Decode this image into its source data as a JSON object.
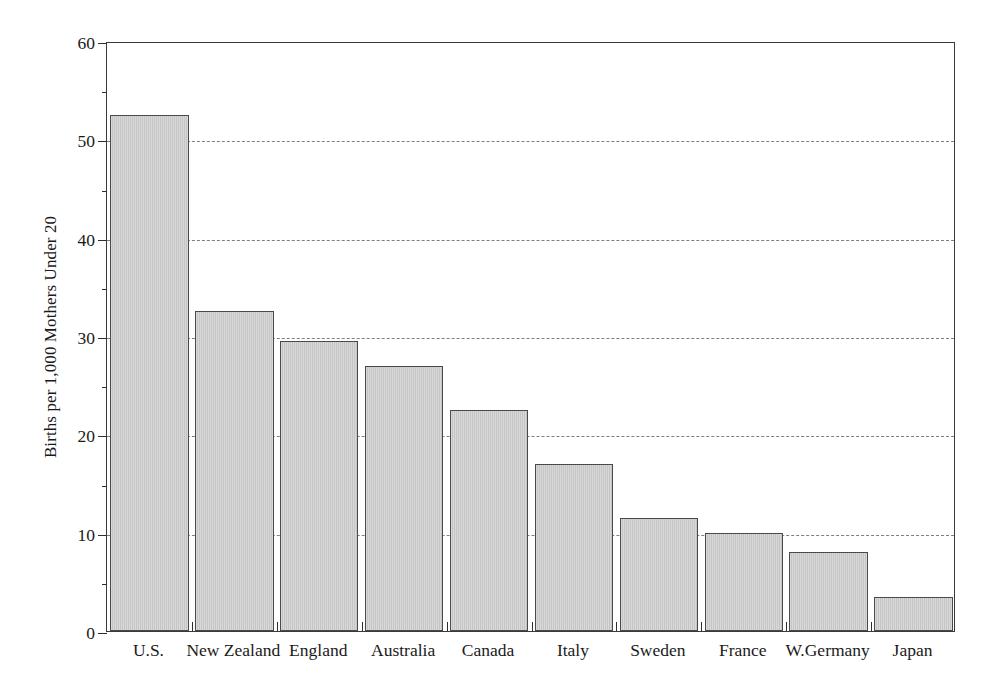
{
  "chart_data": {
    "type": "bar",
    "title": "",
    "subtitle": "",
    "xlabel": "",
    "ylabel": "Births per 1,000 Mothers Under 20",
    "categories": [
      "U.S.",
      "New Zealand",
      "England",
      "Australia",
      "Canada",
      "Italy",
      "Sweden",
      "France",
      "W.Germany",
      "Japan"
    ],
    "values": [
      52.5,
      32.5,
      29.5,
      27.0,
      22.5,
      17.0,
      11.5,
      10.0,
      8.0,
      3.5
    ],
    "ylim": [
      0,
      60
    ],
    "y_ticks": [
      0,
      10,
      20,
      30,
      40,
      50,
      60
    ],
    "y_tick_labels": [
      "0",
      "10",
      "20",
      "30",
      "40",
      "50",
      "60"
    ],
    "y_minor_ticks": [
      5,
      15,
      25,
      35,
      45,
      55
    ],
    "gridlines": [
      10,
      20,
      30,
      40,
      50
    ],
    "grid": true,
    "grid_style": "dashed",
    "legend": "none",
    "bar_fill_color": "#c9c9c9",
    "bar_edge_color": "#4a4a4a",
    "grid_color": "#7e7e8c",
    "axis_color": "#3a3a3a",
    "background_color": "#ffffff"
  }
}
